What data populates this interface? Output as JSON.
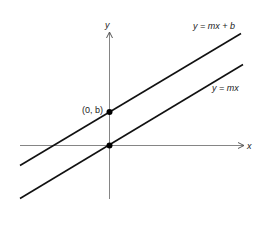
{
  "diagram": {
    "axes": {
      "x_label": "x",
      "y_label": "y"
    },
    "lines": [
      {
        "label": "y = mx + b",
        "description": "line with y-intercept b"
      },
      {
        "label": "y = mx",
        "description": "line through origin"
      }
    ],
    "points": [
      {
        "label": "(0, b)",
        "description": "y-intercept of y = mx + b"
      },
      {
        "label": "",
        "description": "origin"
      }
    ],
    "colors": {
      "ink": "#111111",
      "axis": "#555555",
      "background": "#ffffff"
    }
  }
}
